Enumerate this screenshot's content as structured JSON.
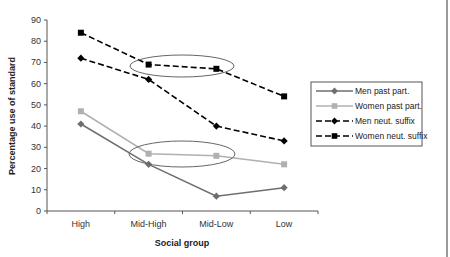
{
  "chart_data": {
    "type": "line",
    "title": "",
    "xlabel": "Social group",
    "ylabel": "Percentage use of standard",
    "categories": [
      "High",
      "Mid-High",
      "Mid-Low",
      "Low"
    ],
    "ylim": [
      0,
      90
    ],
    "yticks": [
      0,
      10,
      20,
      30,
      40,
      50,
      60,
      70,
      80,
      90
    ],
    "grid": false,
    "legend_position": "right",
    "series": [
      {
        "name": "Men past part.",
        "values": [
          41,
          22,
          7,
          11
        ],
        "color": "#6e6e6e",
        "dash": "solid",
        "marker": "diamond"
      },
      {
        "name": "Women past part.",
        "values": [
          47,
          27,
          26,
          22
        ],
        "color": "#b0b0b0",
        "dash": "solid",
        "marker": "square"
      },
      {
        "name": "Men neut. suffix",
        "values": [
          72,
          62,
          40,
          33
        ],
        "color": "#000000",
        "dash": "dashed",
        "marker": "diamond"
      },
      {
        "name": "Women neut. suffix",
        "values": [
          84,
          69,
          67,
          54
        ],
        "color": "#000000",
        "dash": "dashed",
        "marker": "square"
      }
    ],
    "annotations": [
      {
        "type": "ellipse",
        "around": "Women neut. suffix Mid-High to Mid-Low"
      },
      {
        "type": "ellipse",
        "around": "Women past part. Mid-High to Mid-Low"
      }
    ]
  }
}
